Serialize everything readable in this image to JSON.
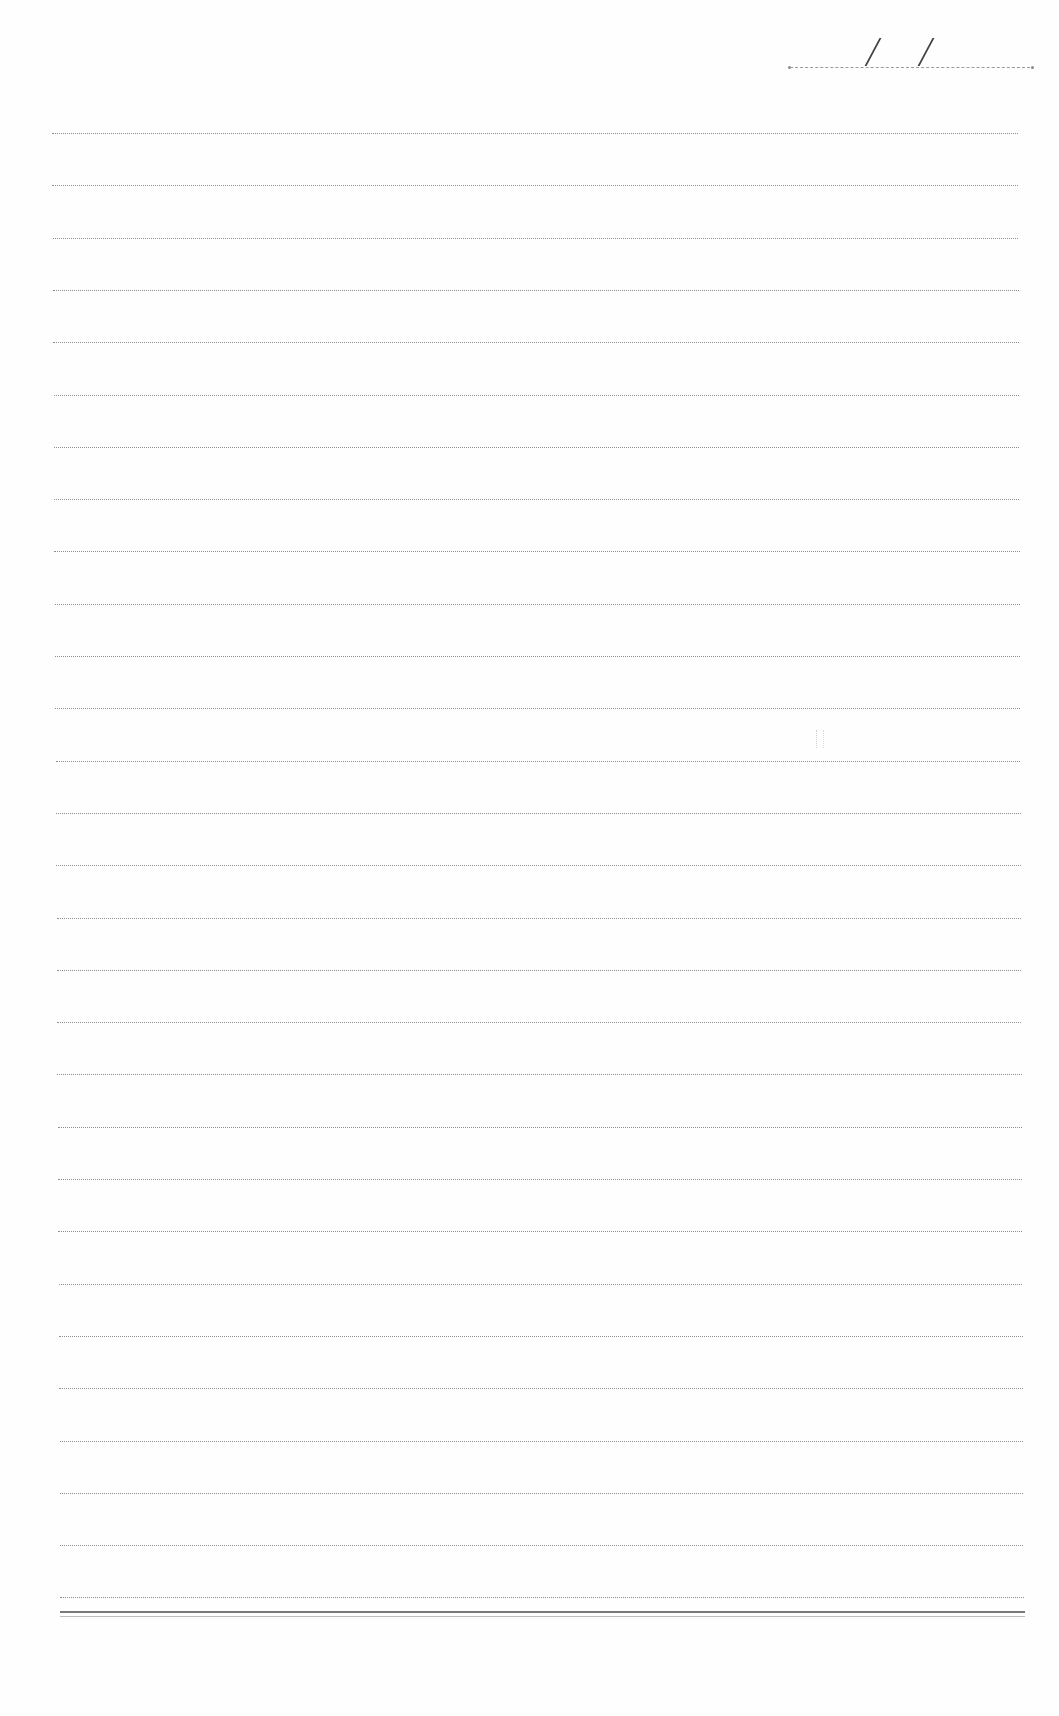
{
  "document": {
    "type": "lined notebook page",
    "background": "#fefefe",
    "line_color": "#8c8c8c"
  },
  "date_field": {
    "separator_1": "/",
    "separator_2": "/",
    "value": ""
  },
  "ruled_lines": {
    "count": 29,
    "first_y": 133,
    "spacing": 52.3,
    "left": 52,
    "right": 1018
  },
  "bottom_rule": {
    "y": 1611,
    "style": "double"
  }
}
